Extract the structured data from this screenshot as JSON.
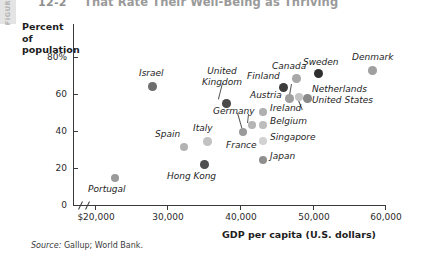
{
  "figure": {
    "tab_label": "FIGURE",
    "number": "12-2",
    "title": "That Rate Their Well-Being as Thriving"
  },
  "axes": {
    "y_title_line1": "Percent of",
    "y_title_line2": "population",
    "x_title": "GDP per capita (U.S. dollars)",
    "y_ticks": [
      "80%",
      "60",
      "40",
      "20",
      "0"
    ],
    "x_ticks": [
      "$20,000",
      "30,000",
      "40,000",
      "50,000",
      "60,000"
    ]
  },
  "source": {
    "label": "Source:",
    "text": "Gallup; World Bank."
  },
  "chart_data": {
    "type": "scatter",
    "title": "That Rate Their Well-Being as Thriving",
    "xlabel": "GDP per capita (U.S. dollars)",
    "ylabel": "Percent of population",
    "xlim": [
      18000,
      61000
    ],
    "ylim": [
      0,
      88
    ],
    "xticks": [
      20000,
      30000,
      40000,
      50000,
      60000
    ],
    "yticks": [
      0,
      20,
      40,
      60,
      80
    ],
    "grid": false,
    "legend": false,
    "axis_break_x": true,
    "points": [
      {
        "label": "Portugal",
        "x": 23000,
        "y": 14,
        "color": "#9a9a9a"
      },
      {
        "label": "Israel",
        "x": 29500,
        "y": 62,
        "color": "#6e6e6e"
      },
      {
        "label": "Hong Kong",
        "x": 33500,
        "y": 21,
        "color": "#4f4f4f"
      },
      {
        "label": "Spain",
        "x": 32000,
        "y": 34,
        "color": "#b3b3b3"
      },
      {
        "label": "Italy",
        "x": 34500,
        "y": 37,
        "color": "#c2c2c2"
      },
      {
        "label": "United Kingdom",
        "x": 36500,
        "y": 54,
        "color": "#4a4a4a"
      },
      {
        "label": "France",
        "x": 39000,
        "y": 41,
        "color": "#9a9a9a"
      },
      {
        "label": "Germany",
        "x": 40200,
        "y": 44,
        "color": "#b5b5b5"
      },
      {
        "label": "Finland",
        "x": 44500,
        "y": 66,
        "color": "#3c3c3c"
      },
      {
        "label": "Canada",
        "x": 46200,
        "y": 71,
        "color": "#a8a8a8"
      },
      {
        "label": "Austria",
        "x": 45400,
        "y": 59,
        "color": "#9e9e9e"
      },
      {
        "label": "Netherlands",
        "x": 46600,
        "y": 59,
        "color": "#c4c4c4"
      },
      {
        "label": "United States",
        "x": 47600,
        "y": 59,
        "color": "#8a8a8a"
      },
      {
        "label": "Ireland",
        "x": 43000,
        "y": 51,
        "color": "#b0b0b0"
      },
      {
        "label": "Belgium",
        "x": 42400,
        "y": 45,
        "color": "#bdbdbd"
      },
      {
        "label": "Singapore",
        "x": 42400,
        "y": 37,
        "color": "#d2d2d2"
      },
      {
        "label": "Japan",
        "x": 42400,
        "y": 26,
        "color": "#8e8e8e"
      },
      {
        "label": "Sweden",
        "x": 49800,
        "y": 70,
        "color": "#2e2e2e"
      },
      {
        "label": "Denmark",
        "x": 56000,
        "y": 72,
        "color": "#a0a0a0"
      }
    ]
  },
  "markers": [
    {
      "name": "portugal",
      "left": 111,
      "top": 174,
      "size": 8,
      "color": "#9a9a9a"
    },
    {
      "name": "israel",
      "left": 148,
      "top": 82,
      "size": 8.5,
      "color": "#6e6e6e"
    },
    {
      "name": "hong-kong",
      "left": 200,
      "top": 160,
      "size": 8.5,
      "color": "#4f4f4f"
    },
    {
      "name": "spain",
      "left": 180,
      "top": 143,
      "size": 8,
      "color": "#b3b3b3"
    },
    {
      "name": "italy",
      "left": 203,
      "top": 137,
      "size": 8.5,
      "color": "#c2c2c2"
    },
    {
      "name": "united-kingdom",
      "left": 222,
      "top": 99,
      "size": 8.5,
      "color": "#4a4a4a"
    },
    {
      "name": "france",
      "left": 239,
      "top": 128,
      "size": 8,
      "color": "#9a9a9a"
    },
    {
      "name": "germany",
      "left": 248,
      "top": 121,
      "size": 7.5,
      "color": "#b5b5b5"
    },
    {
      "name": "finland",
      "left": 279,
      "top": 83,
      "size": 9,
      "color": "#3c3c3c"
    },
    {
      "name": "canada",
      "left": 292,
      "top": 74,
      "size": 8.5,
      "color": "#a8a8a8"
    },
    {
      "name": "austria",
      "left": 285,
      "top": 94,
      "size": 8.5,
      "color": "#9e9e9e"
    },
    {
      "name": "netherlands",
      "left": 295,
      "top": 93,
      "size": 8,
      "color": "#c4c4c4"
    },
    {
      "name": "united-states",
      "left": 303,
      "top": 94,
      "size": 8.5,
      "color": "#8a8a8a"
    },
    {
      "name": "ireland",
      "left": 259,
      "top": 108,
      "size": 7.5,
      "color": "#b0b0b0"
    },
    {
      "name": "belgium",
      "left": 259,
      "top": 121,
      "size": 7.5,
      "color": "#bdbdbd"
    },
    {
      "name": "singapore",
      "left": 259,
      "top": 137,
      "size": 7.5,
      "color": "#d2d2d2"
    },
    {
      "name": "japan",
      "left": 259,
      "top": 156,
      "size": 8,
      "color": "#8e8e8e"
    },
    {
      "name": "sweden",
      "left": 314,
      "top": 69,
      "size": 9,
      "color": "#2e2e2e"
    },
    {
      "name": "denmark",
      "left": 368,
      "top": 66,
      "size": 8.5,
      "color": "#a0a0a0"
    }
  ],
  "labels": [
    {
      "name": "portugal",
      "text": "Portugal",
      "left": 88,
      "top": 184
    },
    {
      "name": "israel",
      "text": "Israel",
      "left": 139,
      "top": 68
    },
    {
      "name": "hong-kong",
      "text": "Hong Kong",
      "left": 167,
      "top": 171
    },
    {
      "name": "spain",
      "text": "Spain",
      "left": 155,
      "top": 129
    },
    {
      "name": "italy",
      "text": "Italy",
      "left": 193,
      "top": 123
    },
    {
      "name": "france",
      "text": "France",
      "left": 226,
      "top": 140
    },
    {
      "name": "germany",
      "text": "Germany",
      "left": 213,
      "top": 106
    },
    {
      "name": "finland",
      "text": "Finland",
      "left": 247,
      "top": 71
    },
    {
      "name": "canada",
      "text": "Canada",
      "left": 272,
      "top": 61
    },
    {
      "name": "austria",
      "text": "Austria",
      "left": 250,
      "top": 90
    },
    {
      "name": "netherlands",
      "text": "Netherlands",
      "left": 312,
      "top": 84
    },
    {
      "name": "united-states",
      "text": "United States",
      "left": 312,
      "top": 95
    },
    {
      "name": "ireland",
      "text": "Ireland",
      "left": 270,
      "top": 103
    },
    {
      "name": "belgium",
      "text": "Belgium",
      "left": 270,
      "top": 116
    },
    {
      "name": "singapore",
      "text": "Singapore",
      "left": 270,
      "top": 132
    },
    {
      "name": "japan",
      "text": "Japan",
      "left": 270,
      "top": 151
    },
    {
      "name": "sweden",
      "text": "Sweden",
      "left": 303,
      "top": 57
    },
    {
      "name": "denmark",
      "text": "Denmark",
      "left": 352,
      "top": 52
    }
  ],
  "labels_multiline": [
    {
      "name": "united-kingdom",
      "line1": "United",
      "line2": "Kingdom",
      "left": 198,
      "top": 66
    }
  ]
}
